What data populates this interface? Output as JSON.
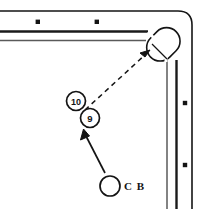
{
  "diagram": {
    "type": "billiards-shot-diagram",
    "colors": {
      "line": "#141414",
      "rail_line": "#1a1a1a",
      "background": "#ffffff",
      "ball_fill": "#ffffff"
    },
    "table": {
      "outer_border": {
        "name": "table-outer-border",
        "corner_radius": 12
      },
      "top_rail": {
        "name": "top-rail",
        "cushion_y": 31,
        "inner_y": 40
      },
      "right_rail": {
        "name": "right-rail",
        "cushion_x": 175,
        "inner_x": 165
      },
      "diamonds": [
        {
          "name": "diamond-top-1",
          "x": 38,
          "y": 22
        },
        {
          "name": "diamond-top-2",
          "x": 97,
          "y": 22
        },
        {
          "name": "diamond-right-1",
          "x": 185,
          "y": 103
        },
        {
          "name": "diamond-right-2",
          "x": 185,
          "y": 165
        }
      ]
    },
    "pocket": {
      "name": "corner-pocket",
      "label": "corner pocket",
      "center_x": 163,
      "center_y": 44,
      "angle_deg": 45
    },
    "balls": [
      {
        "name": "ball-10",
        "label": "10",
        "x": 76,
        "y": 101,
        "r": 9.5,
        "type": "object-ball"
      },
      {
        "name": "ball-9",
        "label": "9",
        "x": 90,
        "y": 118,
        "r": 9.5,
        "type": "object-ball"
      },
      {
        "name": "cue-ball",
        "label": "",
        "x": 110,
        "y": 186,
        "r": 10,
        "type": "cue-ball"
      }
    ],
    "cue_ball_caption": {
      "name": "cue-ball-caption",
      "text": "C B",
      "x": 124,
      "y": 187
    },
    "aim_line": {
      "name": "object-ball-path",
      "style": "dashed",
      "from_x": 85,
      "from_y": 110,
      "to_x": 148,
      "to_y": 52
    },
    "cue_line": {
      "name": "cue-ball-path",
      "style": "solid",
      "from_x": 105,
      "from_y": 172,
      "to_x": 84,
      "to_y": 131
    }
  }
}
